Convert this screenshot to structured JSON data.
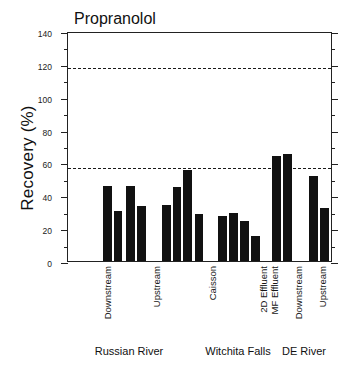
{
  "chart_data": {
    "type": "bar",
    "title": "Propranolol",
    "xlabel": "",
    "ylabel": "Recovery (%)",
    "ylim": [
      0,
      140
    ],
    "ytick_major": [
      0,
      20,
      40,
      60,
      80,
      100,
      120,
      140
    ],
    "ytick_minor": [
      10,
      30,
      50,
      70,
      90,
      110,
      130
    ],
    "grid": false,
    "legend": "none",
    "reference_lines": [
      {
        "name": "upper-recovery-limit",
        "value": 119
      },
      {
        "name": "lower-recovery-limit",
        "value": 58
      }
    ],
    "categories": [
      "Downstream",
      "Upstream",
      "Caisson",
      "2D Effluent",
      "MF Effluent",
      "Downstream",
      "Upstream"
    ],
    "groups": [
      {
        "label": "Russian River",
        "categories": [
          {
            "label": "Downstream",
            "values": [
              45.5,
              30.5,
              45.5,
              33.5
            ]
          },
          {
            "label": "Upstream",
            "values": [
              34.0,
              45.0,
              55.5,
              28.5
            ]
          }
        ]
      },
      {
        "label": "Witchita Falls",
        "categories": [
          {
            "label": "Caisson",
            "values": [
              27.5,
              29.0,
              24.5,
              15.0
            ]
          },
          {
            "label": "2D Effluent",
            "values": [
              64.0
            ]
          },
          {
            "label": "MF Effluent",
            "values": [
              65.0
            ]
          }
        ]
      },
      {
        "label": "DE River",
        "categories": [
          {
            "label": "Downstream",
            "values": [
              51.5
            ]
          },
          {
            "label": "Upstream",
            "values": [
              32.5
            ]
          }
        ]
      }
    ],
    "bars": [
      {
        "id": "rr-downstream-1",
        "group": "Russian River",
        "category": "Downstream",
        "value": 45.5
      },
      {
        "id": "rr-downstream-2",
        "group": "Russian River",
        "category": "Downstream",
        "value": 30.5
      },
      {
        "id": "rr-downstream-3",
        "group": "Russian River",
        "category": "Downstream",
        "value": 45.5
      },
      {
        "id": "rr-downstream-4",
        "group": "Russian River",
        "category": "Downstream",
        "value": 33.5
      },
      {
        "id": "rr-upstream-1",
        "group": "Russian River",
        "category": "Upstream",
        "value": 34.0
      },
      {
        "id": "rr-upstream-2",
        "group": "Russian River",
        "category": "Upstream",
        "value": 45.0
      },
      {
        "id": "rr-upstream-3",
        "group": "Russian River",
        "category": "Upstream",
        "value": 55.5
      },
      {
        "id": "rr-upstream-4",
        "group": "Russian River",
        "category": "Upstream",
        "value": 28.5
      },
      {
        "id": "wf-caisson-1",
        "group": "Witchita Falls",
        "category": "Caisson",
        "value": 27.5
      },
      {
        "id": "wf-caisson-2",
        "group": "Witchita Falls",
        "category": "Caisson",
        "value": 29.0
      },
      {
        "id": "wf-caisson-3",
        "group": "Witchita Falls",
        "category": "Caisson",
        "value": 24.5
      },
      {
        "id": "wf-caisson-4",
        "group": "Witchita Falls",
        "category": "Caisson",
        "value": 15.0
      },
      {
        "id": "wf-2d-effluent",
        "group": "Witchita Falls",
        "category": "2D Effluent",
        "value": 64.0
      },
      {
        "id": "wf-mf-effluent",
        "group": "Witchita Falls",
        "category": "MF Effluent",
        "value": 65.0
      },
      {
        "id": "de-downstream",
        "group": "DE River",
        "category": "Downstream",
        "value": 51.5
      },
      {
        "id": "de-upstream",
        "group": "DE River",
        "category": "Upstream",
        "value": 32.5
      }
    ]
  },
  "axis": {
    "y_labels": [
      "140",
      "120",
      "100",
      "80",
      "60",
      "40",
      "20",
      "0"
    ],
    "y_title": "Recovery (%)"
  },
  "cat_labels": [
    {
      "text": "Downstream",
      "x": 103
    },
    {
      "text": "Upstream",
      "x": 152
    },
    {
      "text": "Caisson",
      "x": 208
    },
    {
      "text": "2D Effluent",
      "x": 259
    },
    {
      "text": "MF Effluent",
      "x": 270
    },
    {
      "text": "Downstream",
      "x": 294
    },
    {
      "text": "Upstream",
      "x": 318
    }
  ],
  "group_labels": [
    {
      "text": "Russian River",
      "x": 129
    },
    {
      "text": "Witchita Falls",
      "x": 238
    },
    {
      "text": "DE River",
      "x": 304
    }
  ]
}
